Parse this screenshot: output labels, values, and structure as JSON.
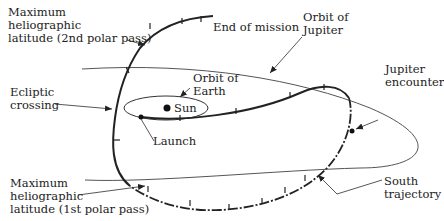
{
  "figure": {
    "labels": {
      "max_lat_2nd": [
        "Maximum",
        "heliographic",
        "latitude (2nd polar pass)"
      ],
      "end_of_mission": "End of mission",
      "orbit_of_jupiter": [
        "Orbit of",
        "Jupiter"
      ],
      "orbit_of_earth": [
        "Orbit of",
        "Earth"
      ],
      "sun": "Sun",
      "ecliptic_crossing": [
        "Ecliptic",
        "crossing"
      ],
      "jupiter_encounter": [
        "Jupiter",
        "encounter"
      ],
      "launch": "Launch",
      "max_lat_1st": [
        "Maximum",
        "heliographic",
        "latitude (1st polar pass)"
      ],
      "south_trajectory": [
        "South",
        "trajectory"
      ]
    },
    "colors": {
      "line": "#222222",
      "thin_line": "#555555",
      "background": "#ffffff"
    }
  }
}
